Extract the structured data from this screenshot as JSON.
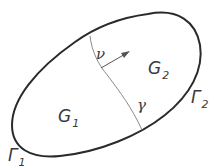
{
  "figure": {
    "colors": {
      "boundary": "#2a2a2a",
      "interface": "#8a8a8a",
      "text": "#3a3a3a",
      "background": "#ffffff"
    },
    "regions": [
      {
        "id": "G1",
        "symbol": "G",
        "subscript": "1"
      },
      {
        "id": "G2",
        "symbol": "G",
        "subscript": "2"
      }
    ],
    "boundaries": [
      {
        "id": "Gamma1",
        "symbol": "Γ",
        "subscript": "1"
      },
      {
        "id": "Gamma2",
        "symbol": "Γ",
        "subscript": "2"
      }
    ],
    "interface": {
      "symbol": "γ"
    },
    "normal": {
      "symbol": "ν"
    }
  }
}
